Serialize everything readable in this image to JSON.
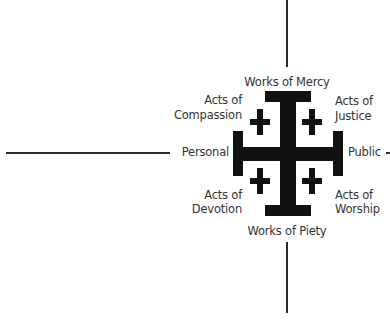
{
  "diagram": {
    "type": "jerusalem-cross-quadrant",
    "axes": {
      "top": "Works of Mercy",
      "bottom": "Works of Piety",
      "left": "Personal",
      "right": "Public"
    },
    "quadrants": {
      "top_left": {
        "line1": "Acts of",
        "line2": "Compassion"
      },
      "top_right": {
        "line1": "Acts of",
        "line2": "Justice"
      },
      "bottom_left": {
        "line1": "Acts of",
        "line2": "Devotion"
      },
      "bottom_right": {
        "line1": "Acts of",
        "line2": "Worship"
      }
    },
    "colors": {
      "cross": "#111111",
      "text": "#333333",
      "lines": "#2b2b2b",
      "background": "#ffffff"
    }
  }
}
